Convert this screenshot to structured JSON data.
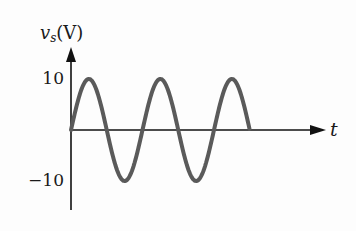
{
  "diagram": {
    "y_axis": {
      "variable": "v",
      "subscript": "s",
      "unit": "(V)"
    },
    "x_axis": {
      "label": "t"
    },
    "ticks": {
      "pos": "10",
      "neg": "−10"
    },
    "colors": {
      "wave": "#5a5a5a",
      "axis": "#111111"
    }
  },
  "chart_data": {
    "type": "line",
    "xlabel": "t",
    "ylabel": "v_s (V)",
    "yticks": [
      10,
      -10
    ],
    "ylim": [
      -10,
      10
    ],
    "series": [
      {
        "name": "v_s",
        "function": "10*sin(wt)",
        "amplitude": 10,
        "cycles": 2.5
      }
    ]
  }
}
